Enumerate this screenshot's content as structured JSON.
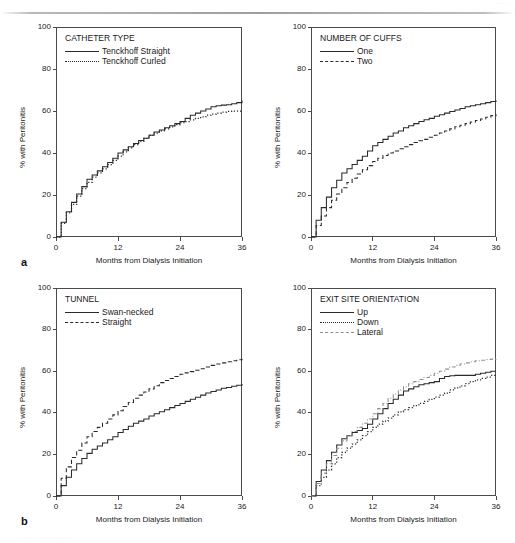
{
  "figure": {
    "panel_letters": [
      "a",
      "b"
    ],
    "scan_header_fragment": "· ·· ·",
    "scan_footer_fragment": "· · ·  · · · · ·   · · ·· ·  · · ·",
    "axis": {
      "ylabel": "% with Peritonitis",
      "xlabel": "Months from Dialysis Initiation",
      "yticks": [
        "0",
        "20",
        "40",
        "60",
        "80",
        "100"
      ],
      "xticks": [
        "0",
        "12",
        "24",
        "36"
      ],
      "ylim": [
        0,
        100
      ],
      "xlim": [
        0,
        36
      ]
    },
    "colors": {
      "ink": "#1a1a1a",
      "frame": "#4a4a4a",
      "curve": "#2a2a2a",
      "curve_light": "#8f8f8f",
      "background": "#ffffff"
    }
  },
  "chart_data": [
    {
      "id": "catheter-type",
      "type": "line",
      "panel": "a",
      "position": "top-left",
      "title": "CATHETER TYPE",
      "xlabel": "Months from Dialysis Initiation",
      "ylabel": "% with Peritonitis",
      "xlim": [
        0,
        36
      ],
      "ylim": [
        0,
        100
      ],
      "xticks": [
        0,
        12,
        24,
        36
      ],
      "yticks": [
        0,
        20,
        40,
        60,
        80,
        100
      ],
      "grid": false,
      "legend_position": "top-left-inside",
      "series": [
        {
          "name": "Tenckhoff Straight",
          "style": "solid",
          "color": "#2a2a2a",
          "x": [
            0,
            1,
            2,
            3,
            4,
            5,
            6,
            7,
            8,
            9,
            10,
            11,
            12,
            13,
            14,
            15,
            16,
            17,
            18,
            19,
            20,
            21,
            22,
            23,
            24,
            25,
            26,
            27,
            28,
            29,
            30,
            31,
            32,
            33,
            34,
            35,
            36
          ],
          "values": [
            0,
            7,
            12,
            16.5,
            20.5,
            24,
            27.5,
            29.5,
            31.5,
            33.5,
            35.5,
            37.5,
            40,
            41.5,
            43,
            44.5,
            46,
            47,
            48.5,
            50,
            51,
            52,
            53,
            54,
            55,
            56.5,
            58,
            59,
            60,
            61,
            62,
            62.5,
            62.8,
            63,
            63.5,
            64,
            65
          ]
        },
        {
          "name": "Tenckhoff Curled",
          "style": "dotted",
          "color": "#2a2a2a",
          "x": [
            0,
            1,
            2,
            3,
            4,
            5,
            6,
            7,
            8,
            9,
            10,
            11,
            12,
            13,
            14,
            15,
            16,
            17,
            18,
            19,
            20,
            21,
            22,
            23,
            24,
            25,
            26,
            27,
            28,
            29,
            30,
            31,
            32,
            33,
            34,
            35,
            36
          ],
          "values": [
            0,
            6.5,
            11.5,
            15.5,
            19.5,
            23,
            26,
            28.5,
            30.5,
            32.5,
            34.5,
            36.5,
            38.5,
            40.5,
            42.5,
            44,
            45.5,
            47,
            48.5,
            49.5,
            50.5,
            51.5,
            52.5,
            53.5,
            54.5,
            55,
            55.8,
            56.5,
            57.2,
            58,
            58.5,
            59,
            59.5,
            59.8,
            60,
            60,
            60
          ]
        }
      ]
    },
    {
      "id": "number-of-cuffs",
      "type": "line",
      "panel": "a",
      "position": "top-right",
      "title": "NUMBER OF CUFFS",
      "xlabel": "Months from Dialysis Initiation",
      "ylabel": "% with Peritonitis",
      "xlim": [
        0,
        36
      ],
      "ylim": [
        0,
        100
      ],
      "xticks": [
        0,
        12,
        24,
        36
      ],
      "yticks": [
        0,
        20,
        40,
        60,
        80,
        100
      ],
      "grid": false,
      "legend_position": "top-left-inside",
      "series": [
        {
          "name": "One",
          "style": "solid",
          "color": "#2a2a2a",
          "x": [
            0,
            1,
            2,
            3,
            4,
            5,
            6,
            7,
            8,
            9,
            10,
            11,
            12,
            13,
            14,
            15,
            16,
            17,
            18,
            19,
            20,
            21,
            22,
            23,
            24,
            25,
            26,
            27,
            28,
            29,
            30,
            31,
            32,
            33,
            34,
            35,
            36
          ],
          "values": [
            0,
            8,
            14,
            19,
            23.5,
            27,
            30.5,
            32.5,
            34.5,
            36.5,
            38.5,
            41,
            43.5,
            45,
            46.5,
            48,
            49.5,
            50.5,
            52,
            53,
            54,
            55,
            55.8,
            56.5,
            57.5,
            58.2,
            59,
            59.8,
            60.5,
            61.2,
            62,
            62.5,
            63,
            63.5,
            64,
            64.5,
            65
          ]
        },
        {
          "name": "Two",
          "style": "dashed",
          "color": "#2a2a2a",
          "x": [
            0,
            1,
            2,
            3,
            4,
            5,
            6,
            7,
            8,
            9,
            10,
            11,
            12,
            13,
            14,
            15,
            16,
            17,
            18,
            19,
            20,
            21,
            22,
            23,
            24,
            25,
            26,
            27,
            28,
            29,
            30,
            31,
            32,
            33,
            34,
            35,
            36
          ],
          "values": [
            0,
            5.5,
            10,
            14,
            17.5,
            20.5,
            23.5,
            26,
            28,
            30,
            32,
            34,
            36,
            37.5,
            38.8,
            40,
            41,
            42,
            43,
            44,
            45,
            45.8,
            46.5,
            47.5,
            48.5,
            49.5,
            50.5,
            51.5,
            52.5,
            53.2,
            54,
            54.8,
            55.5,
            56.2,
            57,
            57.8,
            58.5
          ]
        }
      ]
    },
    {
      "id": "tunnel",
      "type": "line",
      "panel": "b",
      "position": "bottom-left",
      "title": "TUNNEL",
      "xlabel": "Months from Dialysis Initiation",
      "ylabel": "% with Peritonitis",
      "xlim": [
        0,
        36
      ],
      "ylim": [
        0,
        100
      ],
      "xticks": [
        0,
        12,
        24,
        36
      ],
      "yticks": [
        0,
        20,
        40,
        60,
        80,
        100
      ],
      "grid": false,
      "legend_position": "top-left-inside",
      "series": [
        {
          "name": "Swan-necked",
          "style": "solid",
          "color": "#2a2a2a",
          "x": [
            0,
            1,
            2,
            3,
            4,
            5,
            6,
            7,
            8,
            9,
            10,
            11,
            12,
            13,
            14,
            15,
            16,
            17,
            18,
            19,
            20,
            21,
            22,
            23,
            24,
            25,
            26,
            27,
            28,
            29,
            30,
            31,
            32,
            33,
            34,
            35,
            36
          ],
          "values": [
            0,
            5,
            9,
            12.5,
            15.5,
            18,
            20.5,
            22.5,
            24,
            25.5,
            27,
            28.5,
            30.5,
            32,
            33.5,
            35,
            36,
            37,
            38.5,
            39.5,
            40.5,
            41.5,
            42.5,
            43.5,
            44.5,
            45.5,
            46.5,
            47.5,
            48.5,
            49.5,
            50.2,
            51,
            51.8,
            52.2,
            52.8,
            53.2,
            53.8
          ]
        },
        {
          "name": "Straight",
          "style": "dashed",
          "color": "#2a2a2a",
          "x": [
            0,
            1,
            2,
            3,
            4,
            5,
            6,
            7,
            8,
            9,
            10,
            11,
            12,
            13,
            14,
            15,
            16,
            17,
            18,
            19,
            20,
            21,
            22,
            23,
            24,
            25,
            26,
            27,
            28,
            29,
            30,
            31,
            32,
            33,
            34,
            35,
            36
          ],
          "values": [
            0,
            8.5,
            14,
            18.5,
            22,
            25.5,
            28.5,
            31,
            33,
            35,
            37,
            39,
            41,
            43,
            45,
            47,
            48.5,
            50,
            51.5,
            53,
            54.5,
            55.5,
            56.5,
            57.5,
            58.5,
            59.2,
            59.8,
            60.5,
            61.2,
            62,
            62.8,
            63.5,
            64,
            64.5,
            65,
            65.5,
            66
          ]
        }
      ]
    },
    {
      "id": "exit-site-orientation",
      "type": "line",
      "panel": "b",
      "position": "bottom-right",
      "title": "EXIT SITE ORIENTATION",
      "xlabel": "Months from Dialysis Initiation",
      "ylabel": "% with Peritonitis",
      "xlim": [
        0,
        36
      ],
      "ylim": [
        0,
        100
      ],
      "xticks": [
        0,
        12,
        24,
        36
      ],
      "yticks": [
        0,
        20,
        40,
        60,
        80,
        100
      ],
      "grid": false,
      "legend_position": "top-left-inside",
      "series": [
        {
          "name": "Up",
          "style": "solid",
          "color": "#2a2a2a",
          "x": [
            0,
            1,
            2,
            3,
            4,
            5,
            6,
            7,
            8,
            9,
            10,
            11,
            12,
            13,
            14,
            15,
            16,
            17,
            18,
            19,
            20,
            21,
            22,
            23,
            24,
            25,
            26,
            27,
            28,
            29,
            30,
            31,
            32,
            33,
            34,
            35,
            36
          ],
          "values": [
            0,
            7,
            12.5,
            17,
            21,
            24.5,
            27.5,
            29,
            30.5,
            31.5,
            32.5,
            34.5,
            37,
            39.5,
            42,
            44.5,
            46.5,
            48.5,
            50.5,
            51.5,
            52.5,
            53.5,
            54,
            54.5,
            55,
            56.5,
            57.5,
            57.8,
            58,
            58,
            58,
            58,
            58.5,
            59,
            59.5,
            60,
            60
          ]
        },
        {
          "name": "Down",
          "style": "dotted",
          "color": "#2a2a2a",
          "x": [
            0,
            1,
            2,
            3,
            4,
            5,
            6,
            7,
            8,
            9,
            10,
            11,
            12,
            13,
            14,
            15,
            16,
            17,
            18,
            19,
            20,
            21,
            22,
            23,
            24,
            25,
            26,
            27,
            28,
            29,
            30,
            31,
            32,
            33,
            34,
            35,
            36
          ],
          "values": [
            0,
            5,
            9,
            12.5,
            15.5,
            18.5,
            21,
            23,
            25,
            27,
            29,
            31,
            33,
            34.5,
            36,
            37.5,
            39,
            40.5,
            41.5,
            42.5,
            43.5,
            44.5,
            45.5,
            46.5,
            47.5,
            48.5,
            49.5,
            51,
            52,
            53,
            54,
            55,
            55.8,
            56.5,
            57.2,
            58,
            58.5
          ]
        },
        {
          "name": "Lateral",
          "style": "dash-dot",
          "color": "#8f8f8f",
          "x": [
            0,
            1,
            2,
            3,
            4,
            5,
            6,
            7,
            8,
            9,
            10,
            11,
            12,
            13,
            14,
            15,
            16,
            17,
            18,
            19,
            20,
            21,
            22,
            23,
            24,
            25,
            26,
            27,
            28,
            29,
            30,
            31,
            32,
            33,
            34,
            35,
            36
          ],
          "values": [
            0,
            6,
            11,
            15.5,
            19.5,
            23,
            26.5,
            29,
            31,
            33,
            35,
            37,
            39.5,
            42,
            44.5,
            47,
            49,
            51,
            52.5,
            54,
            55,
            56,
            57,
            58,
            59,
            60,
            61,
            62,
            62.8,
            63.5,
            64,
            64.5,
            65,
            65.3,
            65.6,
            65.8,
            66
          ]
        }
      ]
    }
  ]
}
